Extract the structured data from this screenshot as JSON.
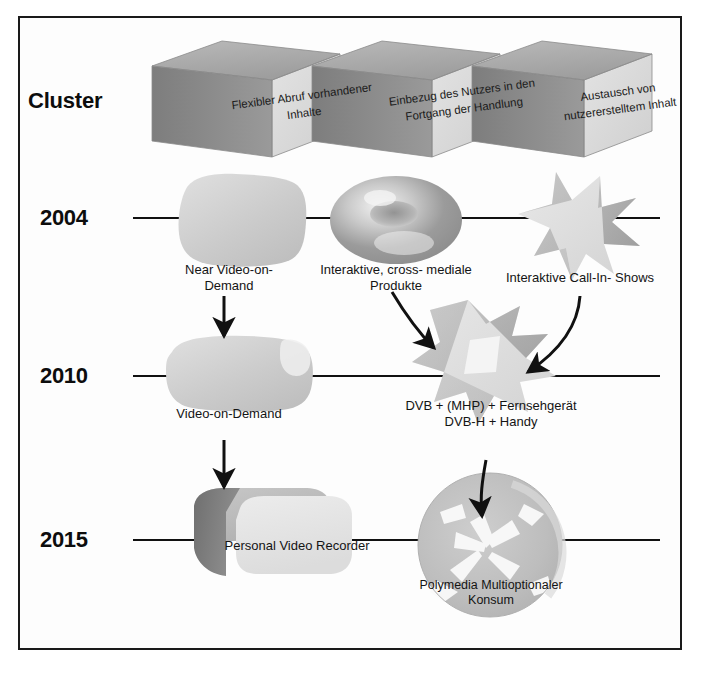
{
  "diagram": {
    "row_header_label": "Cluster",
    "frame_color": "#1a1a1a",
    "background_color": "#ffffff",
    "clusters": [
      {
        "id": "cluster-1",
        "label": "Flexibler Abruf\nvorhandener Inhalte"
      },
      {
        "id": "cluster-2",
        "label": "Einbezug des Nutzers\nin den Fortgang\nder Handlung"
      },
      {
        "id": "cluster-3",
        "label": "Austausch von\nnutzererstelltem\nInhalt"
      }
    ],
    "timeline_rows": [
      {
        "id": "row-2004",
        "year": "2004",
        "line_y": 218
      },
      {
        "id": "row-2010",
        "year": "2010",
        "line_y": 376
      },
      {
        "id": "row-2015",
        "year": "2015",
        "line_y": 540
      }
    ],
    "nodes": [
      {
        "id": "node-near-vod",
        "label": "Near Video-on-\nDemand",
        "shape": "rounded-blob",
        "column": 1,
        "row": "2004"
      },
      {
        "id": "node-crossmedia",
        "label": "Interaktive, cross-\nmediale Produkte",
        "shape": "torus",
        "column": 2,
        "row": "2004"
      },
      {
        "id": "node-callin",
        "label": "Interaktive Call-In-\nShows",
        "shape": "starburst",
        "column": 3,
        "row": "2004"
      },
      {
        "id": "node-vod",
        "label": "Video-on-Demand",
        "shape": "rounded-blob",
        "column": 1,
        "row": "2010"
      },
      {
        "id": "node-dvb",
        "label": "DVB + (MHP) +\nFernsehgerät\nDVB-H + Handy",
        "shape": "shard-cluster",
        "column": 2,
        "row": "2010"
      },
      {
        "id": "node-pvr",
        "label": "Personal Video\nRecorder",
        "shape": "slab-3d",
        "column": 1,
        "row": "2015"
      },
      {
        "id": "node-polymedia",
        "label": "Polymedia\nMultioptionaler\nKonsum",
        "shape": "radial-disc",
        "column": 2,
        "row": "2015"
      }
    ],
    "connectors": [
      {
        "id": "arrow-nearvod-to-vod",
        "from": "node-near-vod",
        "to": "node-vod",
        "style": "straight-down"
      },
      {
        "id": "arrow-vod-to-pvr",
        "from": "node-vod",
        "to": "node-pvr",
        "style": "straight-down"
      },
      {
        "id": "arrow-crossmedia-to-dvb",
        "from": "node-crossmedia",
        "to": "node-dvb",
        "style": "diagonal"
      },
      {
        "id": "arrow-callin-to-dvb",
        "from": "node-callin",
        "to": "node-dvb",
        "style": "curved"
      },
      {
        "id": "arrow-dvb-to-polymedia",
        "from": "node-dvb",
        "to": "node-polymedia",
        "style": "curved-down"
      }
    ]
  }
}
